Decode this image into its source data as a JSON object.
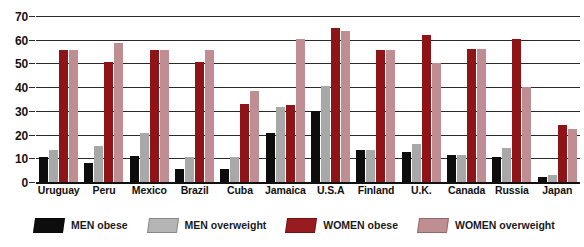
{
  "chart_data": {
    "type": "bar",
    "title": "",
    "subtitle": "",
    "xlabel": "",
    "ylabel": "",
    "ylim": [
      0,
      70
    ],
    "ytick_step": 10,
    "yticks": [
      0,
      10,
      20,
      30,
      40,
      50,
      60,
      70
    ],
    "grid": true,
    "legend_position": "bottom",
    "categories": [
      "Uruguay",
      "Peru",
      "Mexico",
      "Brazil",
      "Cuba",
      "Jamaica",
      "U.S.A",
      "Finland",
      "U.K.",
      "Canada",
      "Russia",
      "Japan"
    ],
    "series": [
      {
        "name": "MEN obese",
        "color": "#0d0d0d",
        "values": [
          10.5,
          8,
          11,
          5.5,
          5.5,
          20.5,
          30,
          13.5,
          12.5,
          11.5,
          10.5,
          2
        ]
      },
      {
        "name": "MEN overweight",
        "color": "#a8a8a8",
        "values": [
          13.5,
          15,
          20.5,
          10.5,
          10.5,
          31.5,
          40.5,
          13.5,
          16,
          11.5,
          14.5,
          3
        ]
      },
      {
        "name": "WOMEN obese",
        "color": "#8f1418",
        "values": [
          55.5,
          50.5,
          55.5,
          50.5,
          33,
          32.5,
          65,
          55.5,
          62,
          56,
          60.5,
          24
        ]
      },
      {
        "name": "WOMEN overweight",
        "color": "#bf8e92",
        "values": [
          55.5,
          58.5,
          55.5,
          55.5,
          38.5,
          60.5,
          63.5,
          55.5,
          50,
          56,
          40,
          22.5
        ]
      }
    ]
  }
}
